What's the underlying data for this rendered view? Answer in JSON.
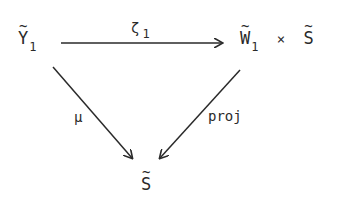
{
  "diagram": {
    "type": "commutative-triangle",
    "nodes": {
      "top_left": {
        "base": "Y",
        "tilde": true,
        "subscript": "1"
      },
      "top_right": {
        "base1": "W",
        "subscript1": "1",
        "times": "×",
        "base2": "S",
        "tilde": true
      },
      "bottom": {
        "base": "S",
        "tilde": true
      }
    },
    "arrows": [
      {
        "from": "top_left",
        "to": "top_right",
        "label": "ζ",
        "label_sub": "1"
      },
      {
        "from": "top_left",
        "to": "bottom",
        "label": "μ"
      },
      {
        "from": "top_right",
        "to": "bottom",
        "label": "proj"
      }
    ],
    "colors": {
      "ink": "#2a2a2a",
      "background": "#ffffff"
    }
  }
}
